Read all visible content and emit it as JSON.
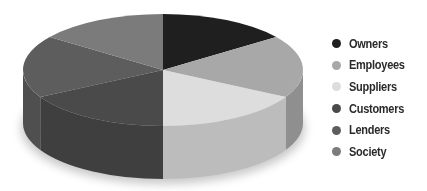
{
  "chart_data": {
    "type": "pie",
    "style": "3d",
    "title": "",
    "categories": [
      "Owners",
      "Employees",
      "Suppliers",
      "Customers",
      "Lenders",
      "Society"
    ],
    "values": [
      15,
      18,
      17,
      17,
      18,
      15
    ],
    "colors": [
      "#1f1f1f",
      "#a8a8a8",
      "#dddddd",
      "#4a4a4a",
      "#5d5d5d",
      "#7b7b7b"
    ],
    "legend_position": "right",
    "data_labels": false
  },
  "legend": {
    "items": [
      {
        "label": "Owners",
        "color": "#1f1f1f"
      },
      {
        "label": "Employees",
        "color": "#a8a8a8"
      },
      {
        "label": "Suppliers",
        "color": "#dddddd"
      },
      {
        "label": "Customers",
        "color": "#4a4a4a"
      },
      {
        "label": "Lenders",
        "color": "#5d5d5d"
      },
      {
        "label": "Society",
        "color": "#7b7b7b"
      }
    ]
  }
}
